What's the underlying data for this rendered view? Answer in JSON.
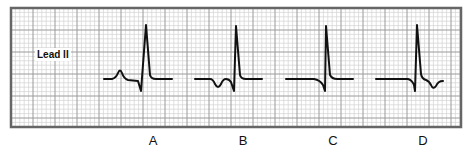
{
  "figure": {
    "lead_label": "Lead II",
    "panels": [
      {
        "label": "A",
        "description": "upright P wave before QRS"
      },
      {
        "label": "B",
        "description": "inverted P wave before QRS"
      },
      {
        "label": "C",
        "description": "no visible P wave"
      },
      {
        "label": "D",
        "description": "inverted P wave after QRS"
      }
    ]
  },
  "colors": {
    "grid_minor": "#d2d2d2",
    "grid_major": "#9a9a9a",
    "border": "#666666",
    "trace": "#111111",
    "background": "#ffffff"
  },
  "grid": {
    "left": 11,
    "top": 8,
    "right": 461,
    "bottom": 127,
    "minor_step": 4.4,
    "major_every": 5
  },
  "traces": {
    "A": "M104,79 L112,79 Q116,78 118,73 Q120,68 122,73 Q124,79 128,80 L138,81 L141,91 L146,25 L150,75 Q151,79 156,79 L172,79",
    "B": "M195,79 L210,79 Q213,79 215,84 Q218,90 221,84 Q223,79 226,79 Q229,79 231,82 L234,91 L236,26 L240,75 Q241,79 246,79 L262,79",
    "C": "M286,79 L314,79 Q320,80 323,85 L325,91 L326,26 L330,75 Q332,79 337,79 L353,79",
    "D": "M376,79 L408,79 Q412,80 414,85 L415,91 L417,25 L421,74 Q422,79 426,80 Q429,81 431,85 Q433,90 436,86 Q438,81 443,81"
  }
}
